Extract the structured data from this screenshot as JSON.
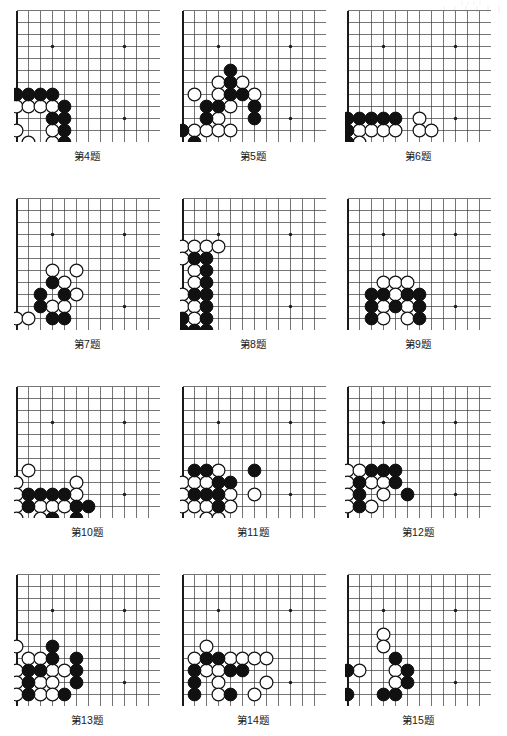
{
  "page": {
    "background_color": "#ffffff",
    "line_color": "#3a3a3a",
    "edge_color": "#1a1a1a",
    "black_stone_color": "#111111",
    "white_stone_color": "#ffffff",
    "caption_color": "#1a1a1a",
    "columns": 3,
    "rows": 4
  },
  "board_spec": {
    "cell": 12,
    "cols": 12,
    "rows": 11,
    "stone_radius": 6.4,
    "note": "each panel shows the lower-left corner of a go board; left and bottom edges are thick board borders"
  },
  "diagrams": [
    {
      "id": "d4",
      "caption": "第4题",
      "panel": {
        "x": 14,
        "y": 8,
        "w": 146,
        "h": 134
      },
      "star_points": [
        [
          3,
          3
        ],
        [
          9,
          3
        ],
        [
          9,
          9
        ]
      ],
      "edges": {
        "left": true,
        "bottom": true,
        "top": false,
        "right": false
      },
      "black": [
        [
          0,
          7
        ],
        [
          1,
          7
        ],
        [
          2,
          7
        ],
        [
          3,
          7
        ],
        [
          4,
          8
        ],
        [
          3,
          9
        ],
        [
          4,
          9
        ],
        [
          4,
          10
        ],
        [
          4,
          11
        ]
      ],
      "white": [
        [
          0,
          8
        ],
        [
          1,
          8
        ],
        [
          2,
          8
        ],
        [
          0,
          10
        ],
        [
          1,
          11
        ],
        [
          3,
          11
        ],
        [
          3,
          8
        ],
        [
          3,
          10
        ]
      ]
    },
    {
      "id": "d5",
      "caption": "第5题",
      "panel": {
        "x": 180,
        "y": 8,
        "w": 146,
        "h": 134
      },
      "star_points": [
        [
          3,
          3
        ],
        [
          9,
          3
        ],
        [
          9,
          9
        ]
      ],
      "edges": {
        "left": true,
        "bottom": true,
        "top": false,
        "right": false
      },
      "black": [
        [
          4,
          5
        ],
        [
          4,
          6
        ],
        [
          4,
          7
        ],
        [
          5,
          7
        ],
        [
          2,
          8
        ],
        [
          3,
          8
        ],
        [
          2,
          9
        ],
        [
          6,
          8
        ],
        [
          6,
          9
        ],
        [
          0,
          10
        ],
        [
          1,
          11
        ]
      ],
      "white": [
        [
          3,
          6
        ],
        [
          5,
          6
        ],
        [
          1,
          7
        ],
        [
          3,
          7
        ],
        [
          6,
          7
        ],
        [
          4,
          8
        ],
        [
          3,
          9
        ],
        [
          1,
          10
        ],
        [
          2,
          10
        ],
        [
          3,
          10
        ],
        [
          4,
          10
        ]
      ]
    },
    {
      "id": "d6",
      "caption": "第6题",
      "panel": {
        "x": 345,
        "y": 8,
        "w": 146,
        "h": 134
      },
      "star_points": [
        [
          3,
          3
        ],
        [
          9,
          3
        ],
        [
          9,
          9
        ]
      ],
      "edges": {
        "left": true,
        "bottom": true,
        "top": false,
        "right": false
      },
      "black": [
        [
          0,
          9
        ],
        [
          1,
          9
        ],
        [
          2,
          9
        ],
        [
          3,
          9
        ],
        [
          4,
          9
        ],
        [
          0,
          10
        ],
        [
          0,
          11
        ]
      ],
      "white": [
        [
          1,
          10
        ],
        [
          2,
          10
        ],
        [
          3,
          10
        ],
        [
          4,
          10
        ],
        [
          1,
          11
        ],
        [
          6,
          9
        ],
        [
          6,
          10
        ],
        [
          7,
          10
        ]
      ]
    },
    {
      "id": "d7",
      "caption": "第7题",
      "panel": {
        "x": 14,
        "y": 196,
        "w": 146,
        "h": 134
      },
      "star_points": [
        [
          3,
          3
        ],
        [
          9,
          3
        ],
        [
          9,
          9
        ]
      ],
      "edges": {
        "left": true,
        "bottom": true,
        "top": false,
        "right": false
      },
      "black": [
        [
          3,
          7
        ],
        [
          2,
          8
        ],
        [
          4,
          8
        ],
        [
          2,
          9
        ],
        [
          3,
          10
        ],
        [
          4,
          10
        ]
      ],
      "white": [
        [
          3,
          6
        ],
        [
          5,
          6
        ],
        [
          4,
          7
        ],
        [
          5,
          8
        ],
        [
          3,
          9
        ],
        [
          4,
          9
        ],
        [
          0,
          10
        ],
        [
          1,
          10
        ]
      ]
    },
    {
      "id": "d8",
      "caption": "第8题",
      "panel": {
        "x": 180,
        "y": 196,
        "w": 146,
        "h": 134
      },
      "star_points": [
        [
          3,
          3
        ],
        [
          9,
          3
        ],
        [
          9,
          9
        ]
      ],
      "edges": {
        "left": true,
        "bottom": true,
        "top": false,
        "right": false
      },
      "black": [
        [
          1,
          5
        ],
        [
          2,
          5
        ],
        [
          2,
          6
        ],
        [
          2,
          7
        ],
        [
          1,
          8
        ],
        [
          2,
          8
        ],
        [
          2,
          9
        ],
        [
          0,
          10
        ],
        [
          2,
          10
        ],
        [
          0,
          11
        ],
        [
          1,
          11
        ],
        [
          2,
          11
        ]
      ],
      "white": [
        [
          0,
          4
        ],
        [
          1,
          4
        ],
        [
          2,
          4
        ],
        [
          3,
          4
        ],
        [
          0,
          5
        ],
        [
          1,
          6
        ],
        [
          1,
          7
        ],
        [
          0,
          8
        ],
        [
          0,
          9
        ],
        [
          1,
          9
        ],
        [
          1,
          10
        ]
      ]
    },
    {
      "id": "d9",
      "caption": "第9题",
      "panel": {
        "x": 345,
        "y": 196,
        "w": 146,
        "h": 134
      },
      "star_points": [
        [
          3,
          3
        ],
        [
          9,
          3
        ],
        [
          9,
          9
        ]
      ],
      "edges": {
        "left": true,
        "bottom": true,
        "top": false,
        "right": false
      },
      "black": [
        [
          2,
          8
        ],
        [
          3,
          8
        ],
        [
          5,
          8
        ],
        [
          6,
          8
        ],
        [
          2,
          9
        ],
        [
          6,
          9
        ],
        [
          4,
          9
        ],
        [
          2,
          10
        ],
        [
          6,
          10
        ]
      ],
      "white": [
        [
          3,
          7
        ],
        [
          4,
          7
        ],
        [
          5,
          7
        ],
        [
          4,
          8
        ],
        [
          3,
          9
        ],
        [
          5,
          9
        ],
        [
          3,
          10
        ],
        [
          5,
          10
        ]
      ]
    },
    {
      "id": "d10",
      "caption": "第10题",
      "panel": {
        "x": 14,
        "y": 384,
        "w": 146,
        "h": 134
      },
      "star_points": [
        [
          3,
          3
        ],
        [
          9,
          3
        ],
        [
          9,
          9
        ]
      ],
      "edges": {
        "left": true,
        "bottom": true,
        "top": false,
        "right": false
      },
      "black": [
        [
          1,
          9
        ],
        [
          2,
          9
        ],
        [
          3,
          9
        ],
        [
          4,
          9
        ],
        [
          1,
          10
        ],
        [
          5,
          10
        ],
        [
          6,
          10
        ],
        [
          3,
          11
        ],
        [
          5,
          11
        ]
      ],
      "white": [
        [
          1,
          7
        ],
        [
          0,
          8
        ],
        [
          5,
          8
        ],
        [
          0,
          9
        ],
        [
          5,
          9
        ],
        [
          0,
          10
        ],
        [
          2,
          10
        ],
        [
          3,
          10
        ],
        [
          4,
          10
        ],
        [
          0,
          11
        ],
        [
          2,
          11
        ]
      ]
    },
    {
      "id": "d11",
      "caption": "第11题",
      "panel": {
        "x": 180,
        "y": 384,
        "w": 146,
        "h": 134
      },
      "star_points": [
        [
          3,
          3
        ],
        [
          9,
          3
        ],
        [
          9,
          9
        ]
      ],
      "edges": {
        "left": true,
        "bottom": true,
        "top": false,
        "right": false
      },
      "black": [
        [
          1,
          7
        ],
        [
          2,
          7
        ],
        [
          3,
          8
        ],
        [
          4,
          8
        ],
        [
          6,
          7
        ],
        [
          1,
          9
        ],
        [
          2,
          9
        ],
        [
          3,
          9
        ],
        [
          3,
          10
        ]
      ],
      "white": [
        [
          3,
          7
        ],
        [
          0,
          8
        ],
        [
          1,
          8
        ],
        [
          2,
          8
        ],
        [
          0,
          9
        ],
        [
          4,
          9
        ],
        [
          6,
          9
        ],
        [
          0,
          10
        ],
        [
          1,
          10
        ],
        [
          2,
          10
        ],
        [
          4,
          10
        ],
        [
          2,
          11
        ],
        [
          3,
          11
        ]
      ]
    },
    {
      "id": "d12",
      "caption": "第12题",
      "panel": {
        "x": 345,
        "y": 384,
        "w": 146,
        "h": 134
      },
      "star_points": [
        [
          3,
          3
        ],
        [
          9,
          3
        ],
        [
          9,
          9
        ]
      ],
      "edges": {
        "left": true,
        "bottom": true,
        "top": false,
        "right": false
      },
      "black": [
        [
          2,
          7
        ],
        [
          3,
          7
        ],
        [
          4,
          7
        ],
        [
          1,
          8
        ],
        [
          4,
          8
        ],
        [
          1,
          9
        ],
        [
          5,
          9
        ],
        [
          1,
          10
        ]
      ],
      "white": [
        [
          0,
          7
        ],
        [
          1,
          7
        ],
        [
          0,
          8
        ],
        [
          2,
          8
        ],
        [
          3,
          8
        ],
        [
          0,
          9
        ],
        [
          3,
          9
        ],
        [
          0,
          10
        ],
        [
          2,
          10
        ]
      ]
    },
    {
      "id": "d13",
      "caption": "第13题",
      "panel": {
        "x": 14,
        "y": 572,
        "w": 146,
        "h": 134
      },
      "star_points": [
        [
          3,
          3
        ],
        [
          9,
          3
        ],
        [
          9,
          9
        ]
      ],
      "edges": {
        "left": true,
        "bottom": true,
        "top": false,
        "right": false
      },
      "black": [
        [
          3,
          6
        ],
        [
          3,
          7
        ],
        [
          1,
          8
        ],
        [
          2,
          8
        ],
        [
          5,
          7
        ],
        [
          5,
          8
        ],
        [
          5,
          9
        ],
        [
          1,
          9
        ],
        [
          1,
          10
        ],
        [
          4,
          10
        ]
      ],
      "white": [
        [
          0,
          6
        ],
        [
          1,
          7
        ],
        [
          2,
          7
        ],
        [
          0,
          8
        ],
        [
          3,
          8
        ],
        [
          4,
          8
        ],
        [
          0,
          9
        ],
        [
          2,
          9
        ],
        [
          3,
          9
        ],
        [
          0,
          10
        ],
        [
          2,
          10
        ],
        [
          3,
          10
        ]
      ]
    },
    {
      "id": "d14",
      "caption": "第14题",
      "panel": {
        "x": 180,
        "y": 572,
        "w": 146,
        "h": 134
      },
      "star_points": [
        [
          3,
          3
        ],
        [
          9,
          3
        ],
        [
          9,
          9
        ]
      ],
      "edges": {
        "left": true,
        "bottom": true,
        "top": false,
        "right": false
      },
      "black": [
        [
          2,
          7
        ],
        [
          3,
          7
        ],
        [
          1,
          8
        ],
        [
          4,
          8
        ],
        [
          5,
          8
        ],
        [
          1,
          9
        ],
        [
          1,
          10
        ],
        [
          4,
          10
        ]
      ],
      "white": [
        [
          2,
          6
        ],
        [
          1,
          7
        ],
        [
          4,
          7
        ],
        [
          5,
          7
        ],
        [
          6,
          7
        ],
        [
          7,
          7
        ],
        [
          2,
          8
        ],
        [
          3,
          8
        ],
        [
          3,
          9
        ],
        [
          7,
          9
        ],
        [
          3,
          10
        ],
        [
          6,
          10
        ]
      ]
    },
    {
      "id": "d15",
      "caption": "第15题",
      "panel": {
        "x": 345,
        "y": 572,
        "w": 146,
        "h": 134
      },
      "star_points": [
        [
          3,
          3
        ],
        [
          9,
          3
        ],
        [
          9,
          9
        ]
      ],
      "edges": {
        "left": true,
        "bottom": true,
        "top": false,
        "right": false
      },
      "black": [
        [
          4,
          7
        ],
        [
          0,
          8
        ],
        [
          5,
          8
        ],
        [
          5,
          9
        ],
        [
          0,
          10
        ],
        [
          3,
          10
        ],
        [
          4,
          10
        ]
      ],
      "white": [
        [
          3,
          5
        ],
        [
          3,
          6
        ],
        [
          1,
          8
        ],
        [
          4,
          8
        ],
        [
          4,
          9
        ]
      ]
    }
  ],
  "captions": [
    {
      "text": "第4题",
      "x": 14,
      "y": 148,
      "w": 146
    },
    {
      "text": "第5题",
      "x": 180,
      "y": 148,
      "w": 146
    },
    {
      "text": "第6题",
      "x": 345,
      "y": 148,
      "w": 146
    },
    {
      "text": "第7题",
      "x": 14,
      "y": 336,
      "w": 146
    },
    {
      "text": "第8题",
      "x": 180,
      "y": 336,
      "w": 146
    },
    {
      "text": "第9题",
      "x": 345,
      "y": 336,
      "w": 146
    },
    {
      "text": "第10题",
      "x": 14,
      "y": 524,
      "w": 146
    },
    {
      "text": "第11题",
      "x": 180,
      "y": 524,
      "w": 146
    },
    {
      "text": "第12题",
      "x": 345,
      "y": 524,
      "w": 146
    },
    {
      "text": "第13题",
      "x": 14,
      "y": 712,
      "w": 146
    },
    {
      "text": "第14题",
      "x": 180,
      "y": 712,
      "w": 146
    },
    {
      "text": "第15题",
      "x": 345,
      "y": 712,
      "w": 146
    }
  ]
}
